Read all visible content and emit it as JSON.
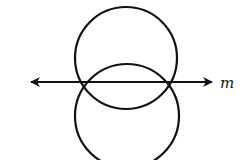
{
  "diagram": {
    "line": {
      "label": "m",
      "arrows": "both"
    },
    "circles": [
      {
        "name": "top-circle",
        "cx": 126,
        "cy": 58,
        "r": 51
      },
      {
        "name": "bottom-circle",
        "cx": 127,
        "cy": 116,
        "r": 52
      }
    ],
    "colors": {
      "stroke": "#111111",
      "background": "#ffffff"
    }
  }
}
